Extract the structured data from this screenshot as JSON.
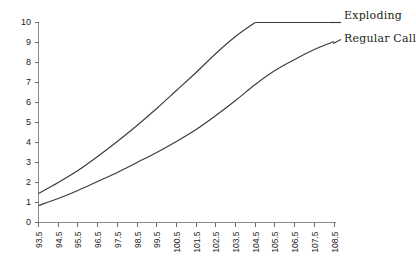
{
  "chart_data": {
    "type": "line",
    "title": "",
    "xlabel": "",
    "ylabel": "",
    "xlim": [
      93.0,
      109.0
    ],
    "ylim": [
      0,
      10
    ],
    "grid": false,
    "legend_position": "right",
    "y_ticks": [
      0,
      1,
      2,
      3,
      4,
      5,
      6,
      7,
      8,
      9,
      10
    ],
    "y_tick_labels": [
      "0",
      "1",
      "2",
      "3",
      "4",
      "5",
      "6",
      "7",
      "8",
      "9",
      "10"
    ],
    "x_ticks": [
      93.5,
      94.5,
      95.5,
      96.5,
      97.5,
      98.5,
      99.5,
      100.5,
      101.5,
      102.5,
      103.5,
      104.5,
      105.5,
      106.5,
      107.5,
      108.5
    ],
    "x_tick_labels": [
      "93.5",
      "94.5",
      "95.5",
      "96.5",
      "97.5",
      "98.5",
      "99.5",
      "100.5",
      "101.5",
      "102.5",
      "103.5",
      "104.5",
      "105.5",
      "106.5",
      "107.5",
      "108.5"
    ],
    "x": [
      93.5,
      94.5,
      95.5,
      96.5,
      97.5,
      98.5,
      99.5,
      100.5,
      101.5,
      102.5,
      103.5,
      104.5,
      105.5,
      106.5,
      107.5,
      108.5
    ],
    "series": [
      {
        "name": "Exploding",
        "color": "#3a3a42",
        "values": [
          1.45,
          2.0,
          2.6,
          3.3,
          4.05,
          4.85,
          5.7,
          6.6,
          7.5,
          8.45,
          9.3,
          10.0,
          10.0,
          10.0,
          10.0,
          10.0
        ]
      },
      {
        "name": "Regular Call",
        "color": "#3a3a42",
        "values": [
          0.85,
          1.2,
          1.6,
          2.05,
          2.5,
          3.0,
          3.5,
          4.05,
          4.65,
          5.35,
          6.1,
          6.9,
          7.6,
          8.15,
          8.65,
          9.05
        ]
      }
    ]
  },
  "legend": {
    "items": [
      {
        "label": "Exploding"
      },
      {
        "label": "Regular Call"
      }
    ]
  }
}
